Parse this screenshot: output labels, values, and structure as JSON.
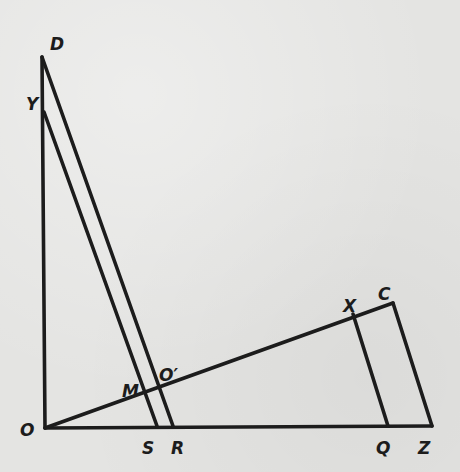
{
  "diagram": {
    "type": "geometry",
    "colors": {
      "ink": "#1c1c1c",
      "paper": "#e4e4e2"
    },
    "points": {
      "O": {
        "label": "O",
        "x": 45,
        "y": 428,
        "lx": 20,
        "ly": 436
      },
      "D": {
        "label": "D",
        "x": 42,
        "y": 57,
        "lx": 50,
        "ly": 50
      },
      "Y": {
        "label": "Y",
        "x": 44,
        "y": 112,
        "lx": 26,
        "ly": 110
      },
      "S": {
        "label": "S",
        "x": 157,
        "y": 426,
        "lx": 142,
        "ly": 454
      },
      "R": {
        "label": "R",
        "x": 173,
        "y": 426,
        "lx": 171,
        "ly": 454
      },
      "Q": {
        "label": "Q",
        "x": 388,
        "y": 426,
        "lx": 376,
        "ly": 454
      },
      "Z": {
        "label": "Z",
        "x": 432,
        "y": 426,
        "lx": 418,
        "ly": 454
      },
      "C": {
        "label": "C",
        "x": 393,
        "y": 303,
        "lx": 378,
        "ly": 300
      },
      "X": {
        "label": "X",
        "x": 353,
        "y": 314,
        "lx": 343,
        "ly": 312
      },
      "M": {
        "label": "M",
        "x": 146,
        "y": 395,
        "lx": 122,
        "ly": 397
      },
      "O'": {
        "label": "O′",
        "x": 161,
        "y": 391,
        "lx": 159,
        "ly": 381
      }
    },
    "segments": [
      {
        "name": "segment-OD",
        "from": "O",
        "to": "D"
      },
      {
        "name": "segment-OZ",
        "from": "O",
        "to": "Z"
      },
      {
        "name": "segment-OC",
        "from": "O",
        "to": "C"
      },
      {
        "name": "segment-CZ",
        "from": "C",
        "to": "Z"
      },
      {
        "name": "segment-XQ",
        "from": "X",
        "to": "Q"
      },
      {
        "name": "segment-DR",
        "from": "D",
        "to": "R"
      },
      {
        "name": "segment-YS",
        "from": "Y",
        "to": "S"
      }
    ]
  }
}
